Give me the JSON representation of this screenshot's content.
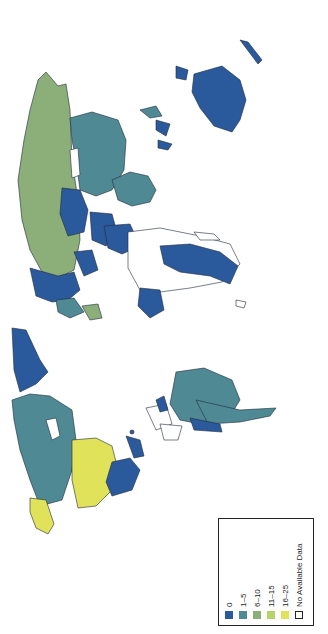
{
  "map": {
    "orientation": "rotated 90 degrees clockwise (north points left)",
    "colors": {
      "c0": "#2b5a9c",
      "c1_5": "#4f8a94",
      "c6_10": "#8cae78",
      "c11_15": "#b7d46a",
      "c16_25": "#e0e35a",
      "none": "#ffffff",
      "border": "#1e2a3a"
    }
  },
  "legend": {
    "items": [
      {
        "label": "0",
        "color": "#2b5a9c"
      },
      {
        "label": "1–5",
        "color": "#4f8a94"
      },
      {
        "label": "6–10",
        "color": "#8cae78"
      },
      {
        "label": "11–15",
        "color": "#b7d46a"
      },
      {
        "label": "16–25",
        "color": "#e0e35a"
      },
      {
        "label": "No Available Data",
        "color": "#ffffff"
      }
    ]
  }
}
